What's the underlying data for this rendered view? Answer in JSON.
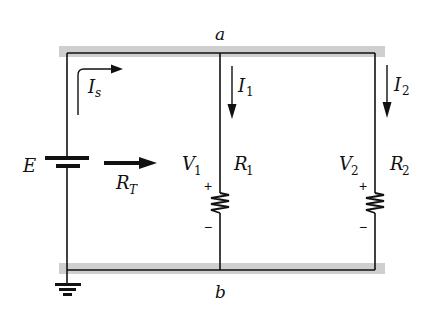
{
  "diagram": {
    "type": "parallel-circuit",
    "nodes": {
      "top": {
        "label": "a"
      },
      "bottom": {
        "label": "b"
      }
    },
    "source": {
      "label": "E",
      "source_current": {
        "main": "I",
        "sub": "s"
      },
      "total_resistance": {
        "main": "R",
        "sub": "T"
      }
    },
    "branches": [
      {
        "current": {
          "main": "I",
          "sub": "1"
        },
        "voltage": {
          "main": "V",
          "sub": "1"
        },
        "resistor": {
          "main": "R",
          "sub": "1"
        },
        "plus": "+",
        "minus": "−"
      },
      {
        "current": {
          "main": "I",
          "sub": "2"
        },
        "voltage": {
          "main": "V",
          "sub": "2"
        },
        "resistor": {
          "main": "R",
          "sub": "2"
        },
        "plus": "+",
        "minus": "−"
      }
    ],
    "colors": {
      "wire": "#111111",
      "rail_highlight": "#cccccc"
    }
  }
}
